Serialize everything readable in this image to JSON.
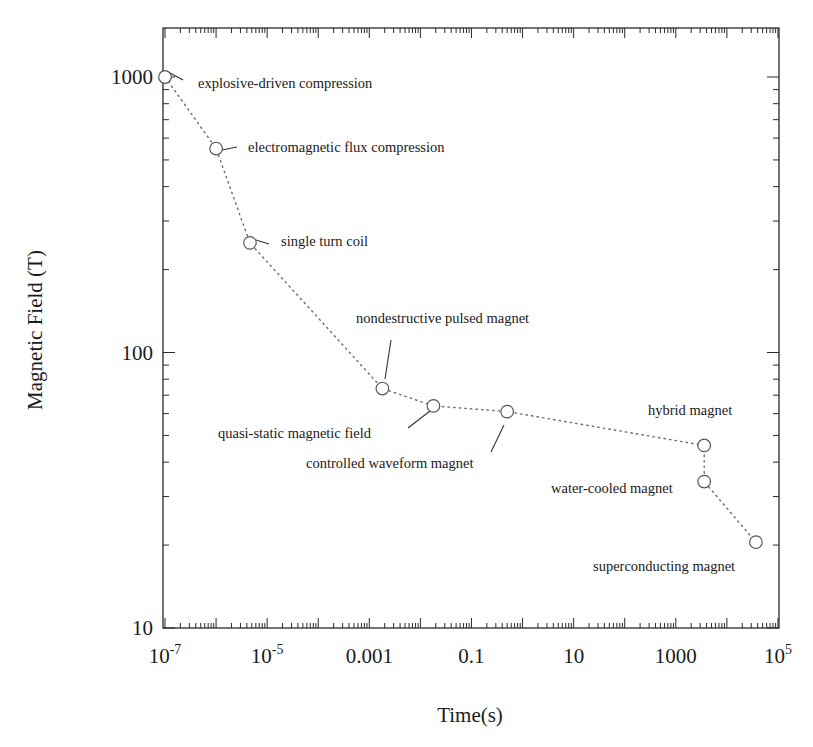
{
  "chart_data": {
    "type": "scatter",
    "title": "",
    "xlabel": "Time(s)",
    "ylabel": "Magnetic Field (T)",
    "xscale": "log",
    "yscale": "log",
    "xlim": [
      1e-07,
      100000
    ],
    "ylim": [
      10,
      1500
    ],
    "grid": false,
    "legend": null,
    "connected_by": "dotted line",
    "x_tick_labels": [
      {
        "value": 1e-07,
        "label": "10",
        "sup": "-7"
      },
      {
        "value": 1e-05,
        "label": "10",
        "sup": "-5"
      },
      {
        "value": 0.001,
        "label": "0.001",
        "sup": ""
      },
      {
        "value": 0.1,
        "label": "0.1",
        "sup": ""
      },
      {
        "value": 10,
        "label": "10",
        "sup": ""
      },
      {
        "value": 1000,
        "label": "1000",
        "sup": ""
      },
      {
        "value": 100000,
        "label": "10",
        "sup": "5"
      }
    ],
    "y_tick_labels": [
      {
        "value": 10,
        "label": "10"
      },
      {
        "value": 100,
        "label": "100"
      },
      {
        "value": 1000,
        "label": "1000"
      }
    ],
    "points": [
      {
        "name": "explosive-driven compression",
        "x": 1e-07,
        "y": 1000
      },
      {
        "name": "electromagnetic flux compression",
        "x": 1e-06,
        "y": 550
      },
      {
        "name": "single turn coil",
        "x": 4.6e-06,
        "y": 250
      },
      {
        "name": "nondestructive pulsed magnet",
        "x": 0.0018,
        "y": 74
      },
      {
        "name": "quasi-static magnetic field",
        "x": 0.018,
        "y": 64
      },
      {
        "name": "controlled waveform magnet",
        "x": 0.5,
        "y": 61
      },
      {
        "name": "hybrid magnet",
        "x": 3600,
        "y": 46
      },
      {
        "name": "water-cooled magnet",
        "x": 3600,
        "y": 34
      },
      {
        "name": "superconducting magnet",
        "x": 37000,
        "y": 20.5
      }
    ]
  },
  "layout": {
    "frame": {
      "left": 163,
      "right": 779,
      "top": 28,
      "bottom": 628
    },
    "x_map": {
      "log_min": -7,
      "px_min": 165,
      "px_per_decade": 51.08
    },
    "y_map": {
      "log_min": 1,
      "px_min": 628,
      "px_per_decade": 275.5
    },
    "labels": [
      {
        "text_key": 0,
        "x": 198,
        "y": 88,
        "anchor": "start",
        "leader": [
          170,
          73,
          183,
          80
        ]
      },
      {
        "text_key": 1,
        "x": 248,
        "y": 152,
        "anchor": "start",
        "leader": [
          222,
          150,
          237,
          147
        ]
      },
      {
        "text_key": 2,
        "x": 281,
        "y": 246,
        "anchor": "start",
        "leader": [
          256,
          240,
          269,
          244
        ]
      },
      {
        "text_key": 3,
        "x": 356,
        "y": 323,
        "anchor": "start",
        "leader": [
          391,
          340,
          385,
          379
        ]
      },
      {
        "text_key": 4,
        "x": 218,
        "y": 438,
        "anchor": "start",
        "leader": [
          408,
          428,
          430,
          411
        ]
      },
      {
        "text_key": 5,
        "x": 306,
        "y": 468,
        "anchor": "start",
        "leader": [
          491,
          452,
          504,
          425
        ]
      },
      {
        "text_key": 6,
        "x": 648,
        "y": 415,
        "anchor": "start",
        "leader": null
      },
      {
        "text_key": 7,
        "x": 551,
        "y": 493,
        "anchor": "start",
        "leader": null
      },
      {
        "text_key": 8,
        "x": 593,
        "y": 571,
        "anchor": "start",
        "leader": null
      }
    ],
    "xlabel_pos": [
      470,
      722
    ],
    "ylabel_pos": [
      42,
      330
    ]
  },
  "colors": {
    "axis": "#2a2a2a",
    "marker_stroke": "#555555",
    "dotted_line": "#6a6a6a",
    "text": "#1a1a1a",
    "background": "#ffffff"
  }
}
